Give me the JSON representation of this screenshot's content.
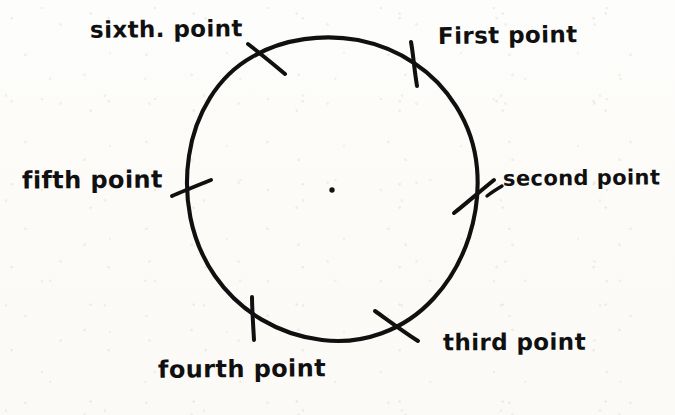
{
  "figure": {
    "kind": "hand-drawn-diagram",
    "ink_color": "#111010",
    "paper_color": "#fdfdfa",
    "width": 675,
    "height": 415
  },
  "circle": {
    "center_x": 332,
    "center_y": 189,
    "radius_x": 145,
    "radius_y": 151,
    "stroke_width": 4
  },
  "center_dot": {
    "x": 332,
    "y": 190,
    "radius": 2.6
  },
  "points": [
    {
      "id": "first",
      "label": "First point",
      "tick_x": 414,
      "tick_y": 62,
      "tick_angle_deg": 8,
      "label_x": 438,
      "label_y": 24,
      "font_size": 23
    },
    {
      "id": "second",
      "label": "second point",
      "tick_x": 474,
      "tick_y": 196,
      "tick_angle_deg": -52,
      "label_x": 503,
      "label_y": 168,
      "font_size": 21
    },
    {
      "id": "third",
      "label": "third point",
      "tick_x": 396,
      "tick_y": 325,
      "tick_angle_deg": -58,
      "label_x": 443,
      "label_y": 331,
      "font_size": 23
    },
    {
      "id": "fourth",
      "label": "fourth point",
      "tick_x": 253,
      "tick_y": 318,
      "tick_angle_deg": 2,
      "label_x": 158,
      "label_y": 357,
      "font_size": 24
    },
    {
      "id": "fifth",
      "label": "fifth point",
      "tick_x": 187,
      "tick_y": 186,
      "tick_angle_deg": -4,
      "label_x": 22,
      "label_y": 168,
      "font_size": 24
    },
    {
      "id": "sixth",
      "label": "sixth. point",
      "tick_x": 266,
      "tick_y": 57,
      "tick_angle_deg": 30,
      "label_x": 90,
      "label_y": 18,
      "font_size": 23
    }
  ]
}
